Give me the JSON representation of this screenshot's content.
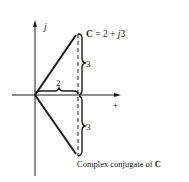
{
  "diagram": {
    "type": "complex-plane",
    "axes": {
      "imaginary_label": "j",
      "real_label": "+"
    },
    "point": {
      "label_bold": "C",
      "label_rest": " = 2 + ",
      "label_j": "j",
      "label_num": "3",
      "real": 2,
      "imag": 3
    },
    "conjugate": {
      "label_text": "Complex conjugate of ",
      "label_bold": "C",
      "real": 2,
      "imag": -3
    },
    "dimensions": {
      "horizontal_label": "2",
      "upper_vertical_label": "3",
      "lower_vertical_label": "3"
    },
    "colors": {
      "ink": "#1a1a1a",
      "background": "#ffffff"
    }
  }
}
